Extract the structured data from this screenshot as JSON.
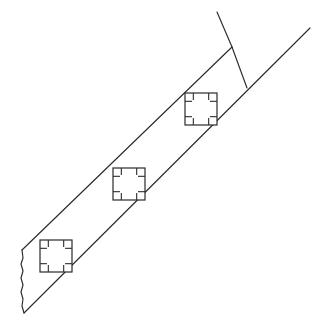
{
  "figure": {
    "canvas": {
      "width": 320,
      "height": 335
    },
    "colors": {
      "background": "#ffffff",
      "stroke": "#2b2b2b"
    },
    "band": {
      "name": "diagonal-band",
      "upper_edge": {
        "x1": 22,
        "y1": 250,
        "x2": 232,
        "y2": 47
      },
      "lower_edge": {
        "x1": 24,
        "y1": 313,
        "x2": 310,
        "y2": 28
      },
      "left_break_edge": {
        "x1": 22,
        "y1": 250,
        "x2": 24,
        "y2": 313
      },
      "break_path": "M22,250 L23,258 L21,264 L23,271 L21,278 L23,285 L21,292 L23,299 L22,306 L24,313"
    },
    "branch": {
      "name": "branch-line",
      "upper_segment": {
        "x1": 217,
        "y1": 12,
        "x2": 232,
        "y2": 47
      },
      "lower_segment": {
        "x1": 232,
        "y1": 47,
        "x2": 247,
        "y2": 88
      },
      "junction_upper": {
        "x": 232,
        "y": 47
      },
      "junction_lower": {
        "x": 247,
        "y": 88
      }
    },
    "components": [
      {
        "label": "component-1",
        "position": "bottom-left",
        "x": 40,
        "y": 240,
        "width": 32,
        "height": 32,
        "pins_per_side": 2
      },
      {
        "label": "component-2",
        "position": "middle",
        "x": 113,
        "y": 168,
        "width": 32,
        "height": 32,
        "pins_per_side": 2
      },
      {
        "label": "component-3",
        "position": "top-right",
        "x": 185,
        "y": 93,
        "width": 32,
        "height": 32,
        "pins_per_side": 2
      }
    ]
  }
}
